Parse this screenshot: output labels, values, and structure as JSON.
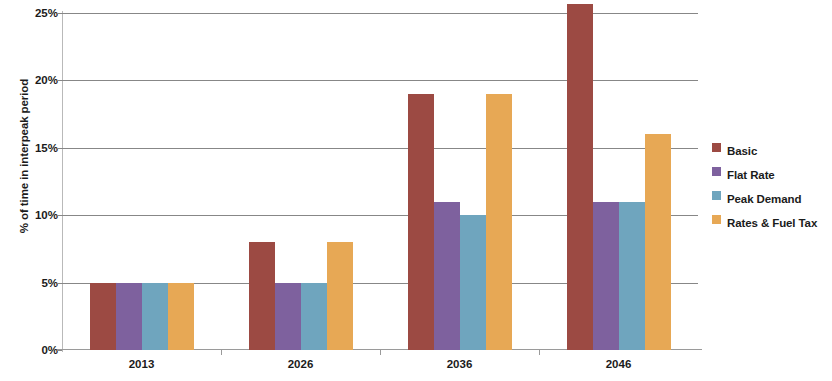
{
  "chart_data": {
    "type": "bar",
    "title": "",
    "subtitle": "",
    "xlabel": "",
    "ylabel": "% of time in interpeak period",
    "categories": [
      "2013",
      "2026",
      "2036",
      "2046"
    ],
    "series": [
      {
        "name": "Basic",
        "color": "#9C4A43",
        "values": [
          5,
          8,
          19,
          25.7
        ]
      },
      {
        "name": "Flat Rate",
        "color": "#7E619E",
        "values": [
          5,
          5,
          11,
          11
        ]
      },
      {
        "name": "Peak Demand",
        "color": "#6FA5BE",
        "values": [
          5,
          5,
          10,
          11
        ]
      },
      {
        "name": "Rates & Fuel Tax",
        "color": "#E7A košutu55",
        "values": [
          5,
          8,
          19,
          16
        ]
      }
    ],
    "ylim": [
      0,
      25
    ],
    "yticks": [
      0,
      5,
      10,
      15,
      20,
      25
    ],
    "ytick_labels": [
      "0%",
      "5%",
      "10%",
      "15%",
      "20%",
      "25%"
    ],
    "grid": true,
    "legend_position": "right",
    "legend_entries": [
      "Basic",
      "Flat Rate",
      "Peak Demand",
      "Rates & Fuel Tax"
    ]
  }
}
